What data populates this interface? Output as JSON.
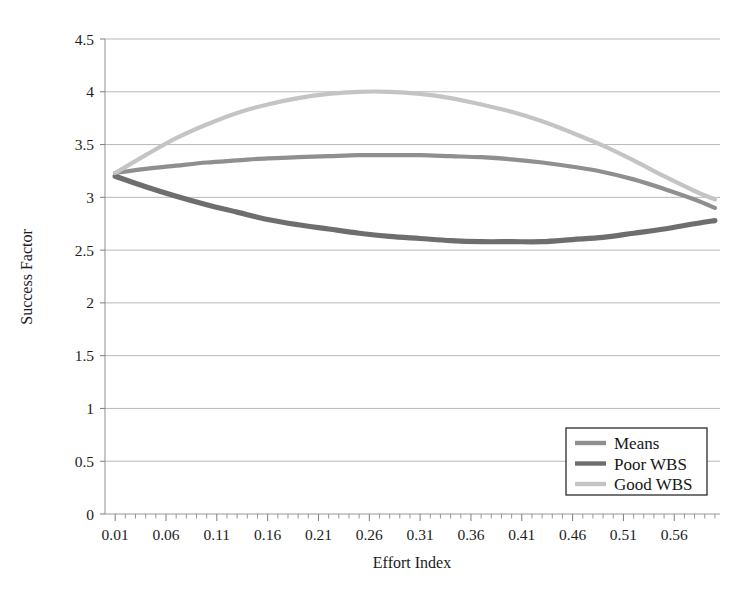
{
  "chart_data": {
    "type": "line",
    "title": "",
    "xlabel": "Effort Index",
    "ylabel": "Success Factor",
    "xlim": [
      0.0,
      0.605
    ],
    "ylim": [
      0,
      4.5
    ],
    "grid": true,
    "legend_position": "inside-bottom-right",
    "x_tick_labels": [
      "0.01",
      "0.06",
      "0.11",
      "0.16",
      "0.21",
      "0.26",
      "0.31",
      "0.36",
      "0.41",
      "0.46",
      "0.51",
      "0.56"
    ],
    "x_tick_values": [
      0.01,
      0.06,
      0.11,
      0.16,
      0.21,
      0.26,
      0.31,
      0.36,
      0.41,
      0.46,
      0.51,
      0.56
    ],
    "x_minor_tick_step": 0.01,
    "y_tick_labels": [
      "0",
      "0.5",
      "1",
      "1.5",
      "2",
      "2.5",
      "3",
      "3.5",
      "4",
      "4.5"
    ],
    "y_tick_values": [
      0,
      0.5,
      1,
      1.5,
      2,
      2.5,
      3,
      3.5,
      4,
      4.5
    ],
    "x": [
      0.01,
      0.04,
      0.07,
      0.1,
      0.13,
      0.16,
      0.19,
      0.22,
      0.25,
      0.28,
      0.31,
      0.34,
      0.37,
      0.4,
      0.43,
      0.46,
      0.49,
      0.52,
      0.55,
      0.58,
      0.6
    ],
    "series": [
      {
        "name": "Means",
        "color": "#8f8f8f",
        "line_width": 4.2,
        "values": [
          3.23,
          3.27,
          3.3,
          3.33,
          3.35,
          3.37,
          3.38,
          3.39,
          3.4,
          3.4,
          3.4,
          3.39,
          3.38,
          3.36,
          3.33,
          3.29,
          3.24,
          3.17,
          3.08,
          2.98,
          2.9
        ]
      },
      {
        "name": "Poor WBS",
        "color": "#6e6e6e",
        "line_width": 5.2,
        "values": [
          3.2,
          3.1,
          3.01,
          2.93,
          2.86,
          2.79,
          2.74,
          2.7,
          2.66,
          2.63,
          2.61,
          2.59,
          2.58,
          2.58,
          2.58,
          2.6,
          2.62,
          2.66,
          2.7,
          2.75,
          2.78
        ]
      },
      {
        "name": "Good WBS",
        "color": "#c4c4c4",
        "line_width": 4.2,
        "values": [
          3.23,
          3.4,
          3.56,
          3.69,
          3.8,
          3.88,
          3.94,
          3.98,
          4.0,
          4.0,
          3.98,
          3.94,
          3.88,
          3.81,
          3.72,
          3.61,
          3.49,
          3.35,
          3.2,
          3.06,
          2.98
        ]
      }
    ]
  },
  "legend": {
    "entries": [
      {
        "label": "Means",
        "color": "#8f8f8f"
      },
      {
        "label": "Poor WBS",
        "color": "#6e6e6e"
      },
      {
        "label": "Good WBS",
        "color": "#c4c4c4"
      }
    ]
  },
  "axes": {
    "x_title": "Effort Index",
    "y_title": "Success Factor"
  }
}
